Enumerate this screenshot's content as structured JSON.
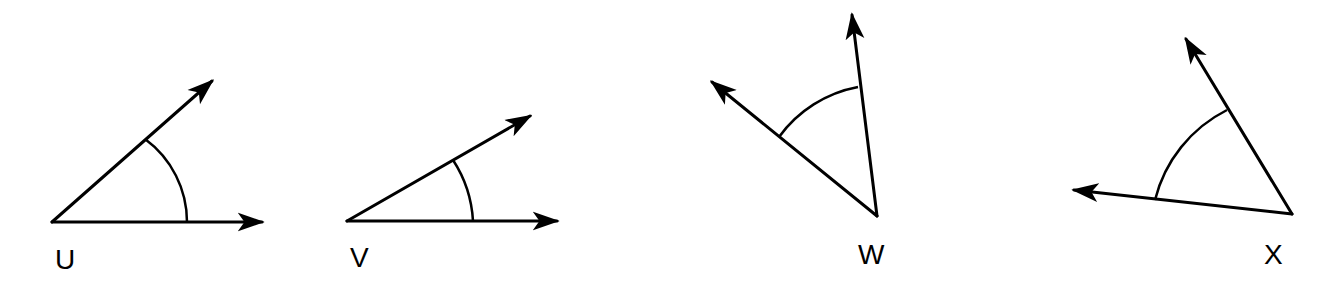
{
  "angles": [
    {
      "label": "U"
    },
    {
      "label": "V"
    },
    {
      "label": "W"
    },
    {
      "label": "X"
    }
  ],
  "colors": {
    "stroke": "#000000",
    "background": "#ffffff"
  }
}
